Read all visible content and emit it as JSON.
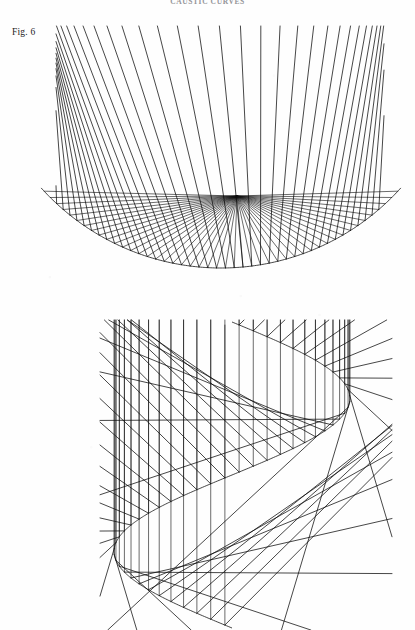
{
  "page": {
    "header_text": "CAUSTIC CURVES",
    "background_color": "#fefefe",
    "ink_color": "#101010",
    "width": 415,
    "height": 630
  },
  "figure": {
    "label": "Fig. 6",
    "caption": "",
    "panel_count": 2
  },
  "chart_data": [
    {
      "type": "line",
      "title": "Upper panel — circular reflector caustic",
      "name": "caustic-circular-arc",
      "xlabel": "",
      "ylabel": "",
      "grid": false,
      "legend": "none",
      "xlim": [
        55,
        385
      ],
      "ylim": [
        25,
        275
      ],
      "mirror": {
        "shape": "circular-arc",
        "center_x": 221,
        "center_y": 26,
        "radius": 242,
        "angle_start_deg": -48,
        "angle_end_deg": 48
      },
      "source": {
        "type": "point-source",
        "x": 237,
        "y": 196,
        "label": "focal-point"
      },
      "rays": {
        "count": 46,
        "incident_direction": "radial-from-focus",
        "reflected": true,
        "description": "Rays emanate from the focal point to the circular arc, reflect, and their reflected segments envelope a cusp caustic."
      },
      "caustic": {
        "shape": "cusp",
        "cusp_x": 237,
        "cusp_y": 190,
        "branches": 2
      },
      "values": [
        46,
        242,
        237,
        196
      ],
      "categories": [
        "ray_count",
        "mirror_radius",
        "focus_x",
        "focus_y"
      ]
    },
    {
      "type": "line",
      "title": "Lower panel — sinusoidal (S-curve) reflector caustic",
      "name": "caustic-s-curve",
      "xlabel": "",
      "ylabel": "",
      "grid": false,
      "legend": "none",
      "xlim": [
        100,
        390
      ],
      "ylim": [
        318,
        630
      ],
      "mirror": {
        "shape": "s-curve",
        "amplitude": 118,
        "center_x": 232,
        "y_top": 322,
        "y_bottom": 628,
        "inflection_x": 232,
        "inflection_y": 474
      },
      "lobes": [
        {
          "name": "upper-lobe",
          "focus_x": 243,
          "focus_y": 386,
          "ray_count": 26,
          "bulge": "right"
        },
        {
          "name": "lower-lobe",
          "focus_x": 222,
          "focus_y": 562,
          "ray_count": 26,
          "bulge": "left"
        }
      ],
      "rays": {
        "count": 52,
        "incident_direction": "vertical",
        "reflected": true,
        "description": "Parallel vertical rays strike the S-shaped mirror and reflect, producing two opposed caustic lobes meeting at the inflection."
      },
      "values": [
        52,
        118,
        232,
        474
      ],
      "categories": [
        "ray_count",
        "amplitude",
        "inflection_x",
        "inflection_y"
      ]
    }
  ]
}
